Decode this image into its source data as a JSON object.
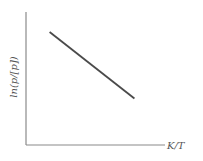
{
  "chart_data": {
    "type": "line",
    "title": "",
    "xlabel": "K/T",
    "ylabel": "ln(p/[p])",
    "grid": false,
    "legend": null,
    "ticks": {
      "x": [],
      "y": []
    },
    "series": [
      {
        "name": "ln(p/[p]) vs K/T",
        "trend": "decreasing linear",
        "points": [
          {
            "x": 0.17,
            "y": 0.85
          },
          {
            "x": 0.78,
            "y": 0.35
          }
        ]
      }
    ],
    "xlim": [
      0,
      1
    ],
    "ylim": [
      0,
      1
    ]
  },
  "colors": {
    "axis": "#8a8a8a",
    "line": "#4a4a4a",
    "text": "#555555"
  }
}
